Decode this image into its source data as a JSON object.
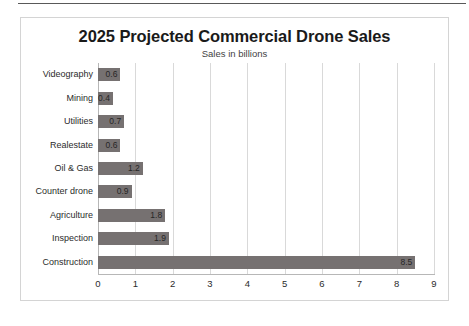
{
  "chart_data": {
    "type": "bar",
    "orientation": "horizontal",
    "title": "2025 Projected Commercial Drone Sales",
    "subtitle": "Sales in billions",
    "xlabel": "",
    "ylabel": "",
    "xlim": [
      0,
      9
    ],
    "xticks": [
      "0",
      "1",
      "2",
      "3",
      "4",
      "5",
      "6",
      "7",
      "8",
      "9"
    ],
    "grid": "vertical",
    "legend": "none",
    "bar_color": "#767171",
    "categories": [
      "Videography",
      "Mining",
      "Utilities",
      "Realestate",
      "Oil & Gas",
      "Counter drone",
      "Agriculture",
      "Inspection",
      "Construction"
    ],
    "values": [
      0.6,
      0.4,
      0.7,
      0.6,
      1.2,
      0.9,
      1.8,
      1.9,
      8.5
    ],
    "value_labels": [
      "0.6",
      "0.4",
      "0.7",
      "0.6",
      "1.2",
      "0.9",
      "1.8",
      "1.9",
      "8.5"
    ]
  }
}
